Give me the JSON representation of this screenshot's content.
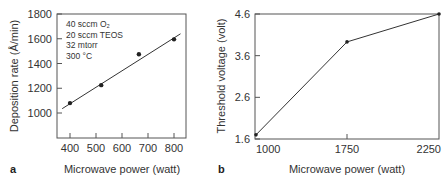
{
  "chart_data": [
    {
      "panel": "a",
      "type": "scatter",
      "xlabel": "Microwave power (watt)",
      "ylabel": "Deposition rate (Å/min)",
      "xlim": [
        350,
        850
      ],
      "ylim": [
        800,
        1800
      ],
      "xticks": [
        400,
        500,
        600,
        700,
        800
      ],
      "yticks": [
        1000,
        1200,
        1400,
        1600,
        1800
      ],
      "grid": false,
      "annotations": [
        "40 sccm O₂",
        "20 sccm TEOS",
        "32 mtorr",
        "300 °C"
      ],
      "series": [
        {
          "name": "measured",
          "x": [
            400,
            520,
            665,
            800
          ],
          "y": [
            1080,
            1225,
            1475,
            1595
          ]
        },
        {
          "name": "linear fit",
          "x": [
            370,
            825
          ],
          "y": [
            1035,
            1640
          ]
        }
      ]
    },
    {
      "panel": "b",
      "type": "line",
      "xlabel": "Microwave power (watt)",
      "ylabel": "Threshold voltage (volt)",
      "xticks": [
        1000,
        1750,
        2250
      ],
      "yticks": [
        1.6,
        2.6,
        3.6,
        4.6
      ],
      "ylim": [
        1.6,
        4.6
      ],
      "grid": false,
      "series": [
        {
          "name": "threshold voltage",
          "x": [
            1000,
            1750,
            2250
          ],
          "y": [
            1.7,
            3.93,
            4.6
          ]
        }
      ]
    }
  ]
}
